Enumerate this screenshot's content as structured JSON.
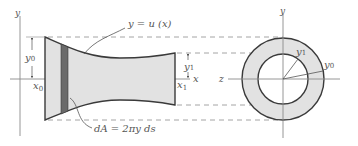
{
  "figure": {
    "colors": {
      "shape_fill": "#e2e2e2",
      "strip_fill": "#6a6a6a",
      "outline": "#3a3a3a",
      "axis": "#8a8a8a",
      "dashed": "#9a9a9a",
      "text": "#555555"
    }
  },
  "labels": {
    "y_axis_left": "y",
    "curve": "y = u (x)",
    "y0_left": "y",
    "y0_left_sub": "0",
    "x0": "x",
    "x0_sub": "0",
    "y1": "y",
    "y1_sub": "1",
    "x1": "x",
    "x1_sub": "1",
    "x_axis": "x",
    "dA": "dA = 2πy ds",
    "y_axis_right": "y",
    "z_axis": "z",
    "y1_right": "y",
    "y1_right_sub": "1",
    "y0_right": "y",
    "y0_right_sub": "0"
  }
}
